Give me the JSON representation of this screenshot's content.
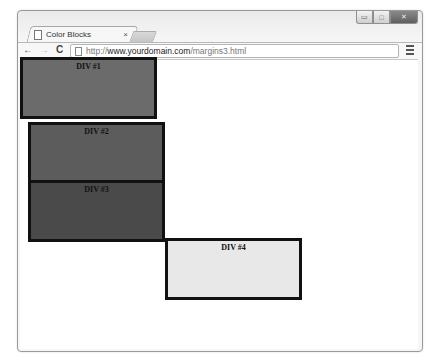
{
  "window": {
    "controls": {
      "minimize": "▭",
      "maximize": "□",
      "close": "✕"
    }
  },
  "tab": {
    "title": "Color Blocks",
    "close_glyph": "×",
    "icon": "page-icon"
  },
  "toolbar": {
    "back_glyph": "←",
    "forward_glyph": "→",
    "reload_glyph": "C",
    "url_scheme": "http://",
    "url_domain": "www.yourdomain.com",
    "url_path": "/margins3.html",
    "menu_icon": "wrench-menu-icon"
  },
  "page": {
    "blocks": [
      {
        "label": "DIV #1",
        "color": "#6b6b6b",
        "x": 20,
        "y": 57
      },
      {
        "label": "DIV #2",
        "color": "#5c5c5c",
        "x": 28,
        "y": 122
      },
      {
        "label": "DIV #3",
        "color": "#4a4a4a",
        "x": 28,
        "y": 180
      },
      {
        "label": "DIV #4",
        "color": "#e8e8e8",
        "x": 165,
        "y": 238
      }
    ]
  }
}
